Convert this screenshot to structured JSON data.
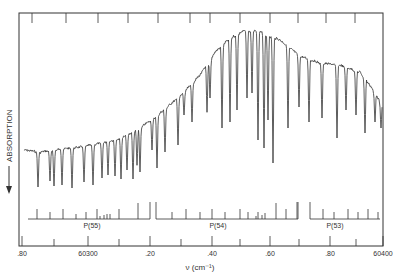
{
  "chart_data": {
    "type": "line",
    "title": "",
    "xlabel": "ν (cm⁻¹)",
    "ylabel": "ABSORPTION",
    "ylabel_arrow": "down",
    "x_range": [
      60302.8,
      60304.0
    ],
    "x_tick_labels": [
      ".80",
      "60300",
      ".20",
      ".40",
      ".60",
      ".80",
      "60400"
    ],
    "x_tick_label_positions_px": [
      22,
      88,
      150,
      212,
      270,
      330,
      383
    ],
    "x_minor_ticks_px": [
      54,
      119,
      181,
      240,
      299,
      356
    ],
    "top_ticks_px": [
      32,
      66,
      98,
      128,
      158,
      190,
      210,
      240,
      270,
      298,
      326,
      355
    ],
    "grid": false,
    "legend": null,
    "envelope": {
      "x_px": [
        24,
        40,
        60,
        80,
        100,
        120,
        140,
        160,
        180,
        200,
        215,
        230,
        245,
        260,
        280,
        300,
        320,
        340,
        360,
        372,
        382
      ],
      "y_px": [
        150,
        152,
        149,
        147,
        143,
        138,
        128,
        113,
        96,
        75,
        52,
        38,
        30,
        31,
        40,
        56,
        63,
        65,
        72,
        88,
        104
      ]
    },
    "absorption_lines": {
      "x_px": [
        38,
        50,
        54,
        62,
        72,
        84,
        93,
        102,
        108,
        115,
        121,
        127,
        133,
        137,
        140,
        152,
        157,
        165,
        178,
        184,
        192,
        207,
        210,
        222,
        230,
        237,
        247,
        252,
        258,
        264,
        268,
        273,
        288,
        299,
        309,
        322,
        337,
        346,
        356,
        365,
        375,
        381
      ],
      "depth_px": [
        187,
        181,
        186,
        185,
        188,
        182,
        185,
        178,
        175,
        176,
        179,
        170,
        179,
        165,
        172,
        150,
        168,
        152,
        145,
        115,
        122,
        112,
        98,
        128,
        122,
        110,
        98,
        93,
        140,
        148,
        120,
        163,
        128,
        107,
        122,
        118,
        138,
        110,
        115,
        133,
        122,
        128
      ]
    },
    "branches": [
      {
        "label": "P(55)",
        "label_x_px": 92,
        "baseline": {
          "x1": 28,
          "x2": 150
        },
        "ticks_x_px": [
          37,
          50,
          63,
          76,
          86,
          97,
          100,
          104,
          107,
          110,
          119,
          138
        ],
        "ticks_h_px": [
          10,
          7,
          10,
          5,
          7,
          10,
          3,
          4,
          5,
          5,
          10,
          16
        ]
      },
      {
        "label": "P(54)",
        "label_x_px": 218,
        "baseline": {
          "x1": 156,
          "x2": 298
        },
        "ticks_x_px": [
          172,
          186,
          200,
          212,
          225,
          240,
          248,
          256,
          258,
          262,
          265,
          276,
          286,
          297
        ],
        "ticks_h_px": [
          7,
          10,
          7,
          10,
          7,
          10,
          7,
          3,
          7,
          4,
          6,
          16,
          10,
          17
        ]
      },
      {
        "label": "P(53)",
        "label_x_px": 335,
        "baseline": {
          "x1": 310,
          "x2": 380
        },
        "ticks_x_px": [
          323,
          334,
          348,
          358,
          368,
          378
        ],
        "ticks_h_px": [
          10,
          7,
          10,
          7,
          10,
          7
        ]
      }
    ],
    "branch_separators_x_px": [
      150,
      156,
      298,
      310
    ],
    "frame_px": {
      "left": 19,
      "top": 13,
      "right": 383,
      "bottom": 246
    },
    "colors": {
      "ink": "#333333",
      "background": "#ffffff"
    }
  }
}
